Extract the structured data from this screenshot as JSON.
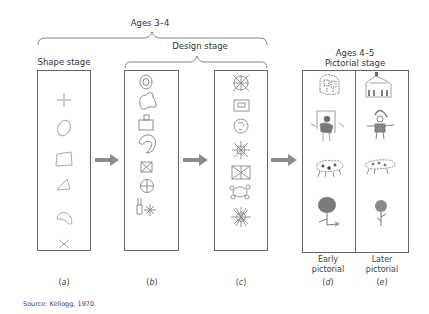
{
  "groups": {
    "ages_3_4": "Ages 3–4",
    "design_stage": "Design stage",
    "shape_stage": "Shape stage",
    "ages_4_5": "Ages 4–5",
    "pictorial_stage": "Pictorial stage"
  },
  "panels": [
    {
      "id": "a",
      "caption_pre": "(",
      "caption_letter": "a",
      "caption_post": ")",
      "stage": "Shape stage",
      "items": [
        "plus",
        "oval",
        "rectangle",
        "triangle",
        "amoeba",
        "x"
      ]
    },
    {
      "id": "b",
      "caption_pre": "(",
      "caption_letter": "b",
      "caption_post": ")",
      "stage": "Design stage",
      "items": [
        "concentric-circle",
        "amoeba-combined",
        "box-with-handle",
        "spiral-blob",
        "crossed-box",
        "crossed-circle",
        "bottle-and-asterisk"
      ]
    },
    {
      "id": "c",
      "caption_pre": "(",
      "caption_letter": "c",
      "caption_post": ")",
      "stage": "Design stage",
      "items": [
        "crossed-circle-x",
        "box-in-box",
        "circle-with-marks",
        "sun-radial",
        "crossed-rect",
        "turtle-shape",
        "mandala-sun"
      ]
    },
    {
      "id": "d",
      "caption_pre": "(",
      "caption_letter": "d",
      "caption_post": ")",
      "sub_label": "Early pictorial",
      "items": [
        "house",
        "person",
        "animal",
        "tree"
      ]
    },
    {
      "id": "e",
      "caption_pre": "(",
      "caption_letter": "e",
      "caption_post": ")",
      "sub_label": "Later pictorial",
      "items": [
        "house",
        "person",
        "animal",
        "flower"
      ]
    }
  ],
  "sub_labels": {
    "early": [
      "Early",
      "pictorial"
    ],
    "later": [
      "Later",
      "pictorial"
    ]
  },
  "source": "Source: Kellogg, 1970.",
  "colors": {
    "arrow": "#8c8c8c",
    "border": "#666666",
    "sketch": "#9a9a9a",
    "dark_sketch": "#6e6e6e"
  }
}
